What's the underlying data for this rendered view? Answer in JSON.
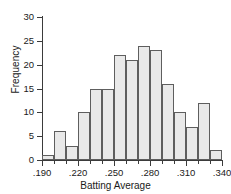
{
  "chart_data": {
    "type": "bar",
    "title": "",
    "xlabel": "Batting Average",
    "ylabel": "Frequency",
    "categories": [
      ".190-.200",
      ".200-.210",
      ".210-.220",
      ".220-.230",
      ".230-.240",
      ".240-.250",
      ".250-.260",
      ".260-.270",
      ".270-.280",
      ".280-.290",
      ".290-.300",
      ".300-.310",
      ".310-.320",
      ".320-.330",
      ".330-.340"
    ],
    "bin_edges": [
      0.19,
      0.2,
      0.21,
      0.22,
      0.23,
      0.24,
      0.25,
      0.26,
      0.27,
      0.28,
      0.29,
      0.3,
      0.31,
      0.32,
      0.33,
      0.34
    ],
    "values": [
      1,
      6,
      3,
      10,
      15,
      15,
      22,
      21,
      24,
      23,
      16,
      10,
      7,
      12,
      2
    ],
    "xlim": [
      0.19,
      0.34
    ],
    "ylim": [
      0,
      30
    ],
    "ytick_labels": [
      "0",
      "5",
      "10",
      "15",
      "20",
      "25",
      "30"
    ],
    "ytick_values": [
      0,
      5,
      10,
      15,
      20,
      25,
      30
    ],
    "xtick_labels": [
      ".190",
      ".220",
      ".250",
      ".280",
      ".310",
      ".340"
    ],
    "xtick_values": [
      0.19,
      0.22,
      0.25,
      0.28,
      0.31,
      0.34
    ],
    "xtick_minor_values": [
      0.2,
      0.21,
      0.23,
      0.24,
      0.26,
      0.27,
      0.29,
      0.3,
      0.32,
      0.33
    ],
    "grid": false,
    "legend": null,
    "bar_fill_color": "#e9e9e9",
    "bar_border_color": "#5e5e5e",
    "axis_color": "#3b3b3b"
  }
}
